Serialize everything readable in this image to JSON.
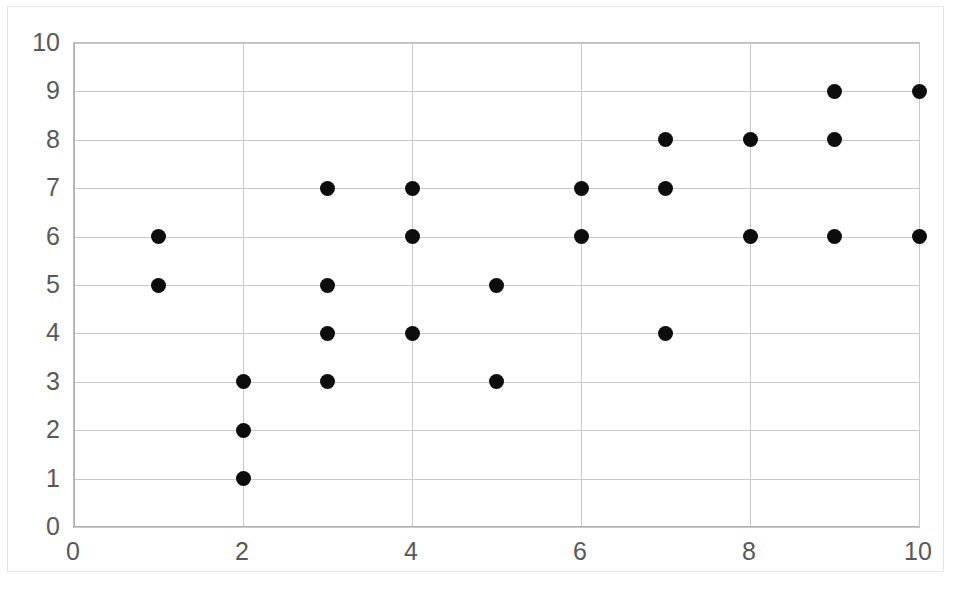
{
  "chart_data": {
    "type": "scatter",
    "title": "",
    "subtitle": "",
    "xlabel": "",
    "ylabel": "",
    "xlim": [
      0,
      10
    ],
    "ylim": [
      0,
      10
    ],
    "grid": true,
    "legend": null,
    "legend_position": "none",
    "marker": {
      "shape": "circle",
      "color": "#0d0d0d",
      "size_px": 15,
      "filled": true
    },
    "x_tick_labels": [
      "0",
      "2",
      "4",
      "6",
      "8",
      "10"
    ],
    "x_tick_values": [
      0,
      2,
      4,
      6,
      8,
      10
    ],
    "y_tick_labels": [
      "0",
      "1",
      "2",
      "3",
      "4",
      "5",
      "6",
      "7",
      "8",
      "9",
      "10"
    ],
    "y_tick_values": [
      0,
      1,
      2,
      3,
      4,
      5,
      6,
      7,
      8,
      9,
      10
    ],
    "x_gridline_values": [
      0,
      2,
      4,
      6,
      8,
      10
    ],
    "y_gridline_values": [
      0,
      1,
      2,
      3,
      4,
      5,
      6,
      7,
      8,
      9,
      10
    ],
    "series": [
      {
        "name": "",
        "points": [
          {
            "x": 1,
            "y": 6
          },
          {
            "x": 1,
            "y": 5
          },
          {
            "x": 2,
            "y": 3
          },
          {
            "x": 2,
            "y": 2
          },
          {
            "x": 2,
            "y": 1
          },
          {
            "x": 3,
            "y": 7
          },
          {
            "x": 3,
            "y": 5
          },
          {
            "x": 3,
            "y": 4
          },
          {
            "x": 3,
            "y": 3
          },
          {
            "x": 4,
            "y": 7
          },
          {
            "x": 4,
            "y": 6
          },
          {
            "x": 4,
            "y": 4
          },
          {
            "x": 5,
            "y": 5
          },
          {
            "x": 5,
            "y": 3
          },
          {
            "x": 6,
            "y": 7
          },
          {
            "x": 6,
            "y": 6
          },
          {
            "x": 7,
            "y": 8
          },
          {
            "x": 7,
            "y": 7
          },
          {
            "x": 7,
            "y": 4
          },
          {
            "x": 8,
            "y": 8
          },
          {
            "x": 8,
            "y": 6
          },
          {
            "x": 9,
            "y": 9
          },
          {
            "x": 9,
            "y": 8
          },
          {
            "x": 9,
            "y": 6
          },
          {
            "x": 10,
            "y": 9
          },
          {
            "x": 10,
            "y": 6
          }
        ]
      }
    ],
    "colors": {
      "marker": "#0d0d0d",
      "gridline": "#c9c9c9",
      "axis": "#b0b0b0",
      "tick_label": "#58595b",
      "plot_background": "#ffffff",
      "frame_border": "#e3e3e3"
    }
  }
}
